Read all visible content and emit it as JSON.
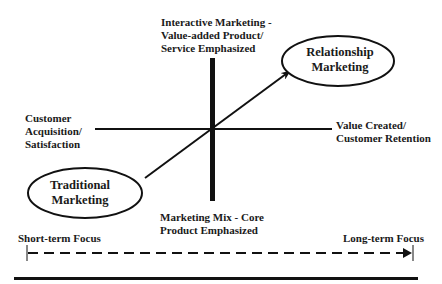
{
  "diagram": {
    "nodes": {
      "relationship": {
        "line1": "Relationship",
        "line2": "Marketing"
      },
      "traditional": {
        "line1": "Traditional",
        "line2": "Marketing"
      }
    },
    "axis_labels": {
      "top": {
        "line1": "Interactive Marketing -",
        "line2": "Value-added Product/",
        "line3": "Service Emphasized"
      },
      "bottom": {
        "line1": "Marketing Mix - Core",
        "line2": "Product Emphasized"
      },
      "left": {
        "line1": "Customer",
        "line2": "Acquisition/",
        "line3": "Satisfaction"
      },
      "right": {
        "line1": "Value Created/",
        "line2": "Customer Retention"
      }
    },
    "timeline": {
      "start": "Short-term Focus",
      "end": "Long-term Focus"
    },
    "colors": {
      "ink": "#111111",
      "background": "#ffffff"
    }
  }
}
